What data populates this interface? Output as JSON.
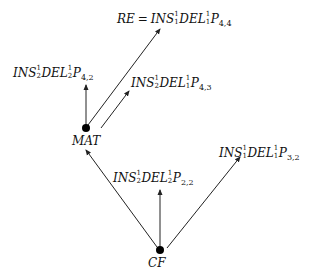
{
  "diagram": {
    "type": "directed-graph",
    "colors": {
      "line": "#222222",
      "node": "#000000",
      "text": "#111111",
      "background": "#ffffff"
    },
    "nodes": [
      {
        "id": "MAT",
        "label": "MAT",
        "x": 86,
        "y": 128
      },
      {
        "id": "CF",
        "label": "CF",
        "x": 160,
        "y": 250
      }
    ],
    "labels": {
      "re": {
        "prefix": "RE",
        "eq": "=",
        "a": "INS",
        "a_sup": "1",
        "a_sub": "1",
        "b": "DEL",
        "b_sup": "1",
        "b_sub": "1",
        "c": "P",
        "c_sub": "4,4"
      },
      "p42": {
        "a": "INS",
        "a_sup": "1",
        "a_sub": "2",
        "b": "DEL",
        "b_sup": "1",
        "b_sub": "2",
        "c": "P",
        "c_sub": "4,2"
      },
      "p43": {
        "a": "INS",
        "a_sup": "1",
        "a_sub": "2",
        "b": "DEL",
        "b_sup": "1",
        "b_sub": "1",
        "c": "P",
        "c_sub": "4,3"
      },
      "p32": {
        "a": "INS",
        "a_sup": "1",
        "a_sub": "1",
        "b": "DEL",
        "b_sup": "1",
        "b_sub": "1",
        "c": "P",
        "c_sub": "3,2"
      },
      "p22": {
        "a": "INS",
        "a_sup": "1",
        "a_sub": "2",
        "b": "DEL",
        "b_sup": "1",
        "b_sub": "2",
        "c": "P",
        "c_sub": "2,2"
      }
    },
    "edges": [
      {
        "from": "MAT",
        "to": "RE = INS_1^1 DEL_1^1 P_{4,4}"
      },
      {
        "from": "MAT",
        "to": "INS_2^1 DEL_2^1 P_{4,2}"
      },
      {
        "from": "MAT",
        "to": "INS_2^1 DEL_1^1 P_{4,3}"
      },
      {
        "from": "CF",
        "to": "MAT"
      },
      {
        "from": "CF",
        "to": "INS_2^1 DEL_2^1 P_{2,2}"
      },
      {
        "from": "CF",
        "to": "INS_1^1 DEL_1^1 P_{3,2}"
      }
    ]
  }
}
